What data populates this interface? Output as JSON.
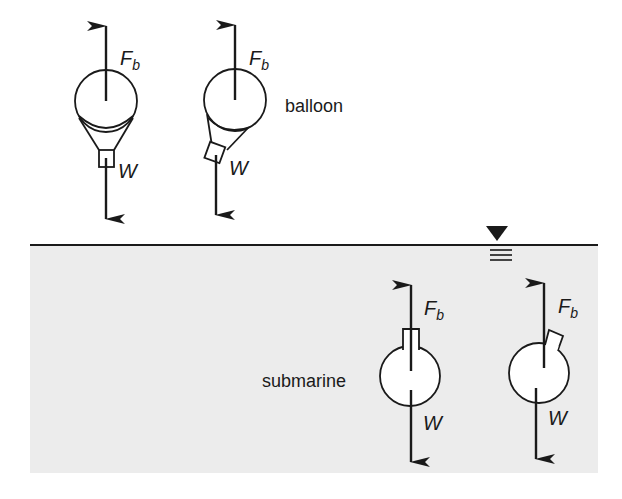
{
  "diagram": {
    "colors": {
      "ink": "#1a1a1a",
      "water": "#ececec",
      "background": "#ffffff",
      "body_fill": "#ffffff"
    },
    "water_surface_symbol": "free-surface-triangle-icon",
    "labels": {
      "balloon": "balloon",
      "submarine": "submarine"
    },
    "forces": {
      "buoyancy": {
        "main": "F",
        "subscript": "b"
      },
      "weight": {
        "main": "W"
      }
    },
    "objects": [
      {
        "id": "balloon-upright",
        "type": "balloon",
        "orientation": "upright"
      },
      {
        "id": "balloon-tilted",
        "type": "balloon",
        "orientation": "tilted"
      },
      {
        "id": "submarine-upright",
        "type": "submarine",
        "orientation": "upright"
      },
      {
        "id": "submarine-tilted",
        "type": "submarine",
        "orientation": "tilted"
      }
    ]
  }
}
